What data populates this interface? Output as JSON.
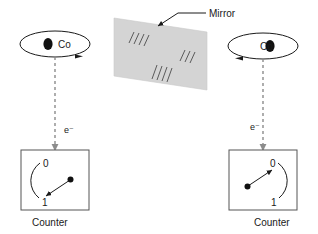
{
  "figure": {
    "background_color": "#ffffff",
    "ink_color": "#1a1a1a",
    "dashed_color": "#8c8c8c",
    "mirror_fill_color": "#d4d4d4",
    "box_stroke_color": "#555555"
  },
  "mirror": {
    "label": "Mirror",
    "hatch_group_count": 3
  },
  "left_system": {
    "nucleus_label": "Co",
    "electron_label": "e⁻",
    "counter_label": "Counter",
    "dial_top_value": "0",
    "dial_bottom_value": "1",
    "spin_direction": "clockwise-from-above",
    "needle_points_to": "1"
  },
  "right_system": {
    "nucleus_label": "Co",
    "electron_label": "e⁻",
    "counter_label": "Counter",
    "dial_top_value": "0",
    "dial_bottom_value": "1",
    "spin_direction": "counterclockwise-from-above",
    "needle_points_to": "0",
    "rendering": "mirror-reflected"
  }
}
